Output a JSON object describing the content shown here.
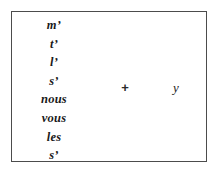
{
  "figure": {
    "type": "linguistic-clitic-ordering-diagram",
    "border_color": "#4c4c4c",
    "background_color": "#ffffff",
    "text_color": "#1a1a1a",
    "pronoun_column": {
      "items": [
        {
          "label": "m’"
        },
        {
          "label": "t’"
        },
        {
          "label": "l’"
        },
        {
          "label": "s’"
        },
        {
          "label": "nous"
        },
        {
          "label": "vous"
        },
        {
          "label": "les"
        },
        {
          "label": "s’"
        }
      ]
    },
    "operator": {
      "symbol": "+",
      "name": "plus-sign"
    },
    "operand": {
      "label": "y"
    }
  }
}
